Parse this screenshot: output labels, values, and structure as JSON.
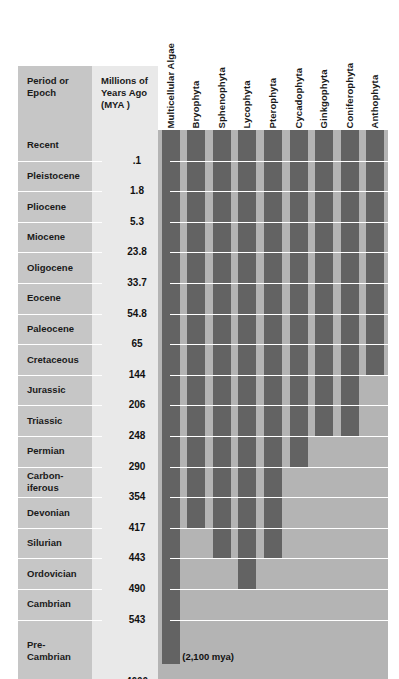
{
  "headers": {
    "period": "Period or\nEpoch",
    "period_line1": "Period or",
    "period_line2": "Epoch",
    "mya_line1": "Millions of",
    "mya_line2": "Years Ago",
    "mya_line3": "(MYA )"
  },
  "annotation": "(2,100 mya)",
  "colors": {
    "label_column": "#c6c6c6",
    "mya_column": "#e9e9e9",
    "plot_background": "#b4b4b4",
    "bar": "#636363",
    "gridline": "#ffffff",
    "text": "#1a1a1a",
    "page": "#ffffff"
  },
  "chart_data": {
    "type": "bar",
    "xlabel": "",
    "ylabel": "Millions of Years Ago (MYA)",
    "orientation": "vertical-range",
    "grid": true,
    "legend_position": "none",
    "note": "Each bar is a horizontal-range (stratigraphic range) bar spanning from its first-appearance age down-column to the present (top of chart).",
    "rows": [
      {
        "epoch": "Recent",
        "epoch_lines": [
          "Recent"
        ],
        "top_mya": 0,
        "bottom_mya": 0.1
      },
      {
        "epoch": "Pleistocene",
        "epoch_lines": [
          "Pleistocene"
        ],
        "top_mya": 0.1,
        "bottom_mya": 1.8
      },
      {
        "epoch": "Pliocene",
        "epoch_lines": [
          "Pliocene"
        ],
        "top_mya": 1.8,
        "bottom_mya": 5.3
      },
      {
        "epoch": "Miocene",
        "epoch_lines": [
          "Miocene"
        ],
        "top_mya": 5.3,
        "bottom_mya": 23.8
      },
      {
        "epoch": "Oligocene",
        "epoch_lines": [
          "Oligocene"
        ],
        "top_mya": 23.8,
        "bottom_mya": 33.7
      },
      {
        "epoch": "Eocene",
        "epoch_lines": [
          "Eocene"
        ],
        "top_mya": 33.7,
        "bottom_mya": 54.8
      },
      {
        "epoch": "Paleocene",
        "epoch_lines": [
          "Paleocene"
        ],
        "top_mya": 54.8,
        "bottom_mya": 65
      },
      {
        "epoch": "Cretaceous",
        "epoch_lines": [
          "Cretaceous"
        ],
        "top_mya": 65,
        "bottom_mya": 144
      },
      {
        "epoch": "Jurassic",
        "epoch_lines": [
          "Jurassic"
        ],
        "top_mya": 144,
        "bottom_mya": 206
      },
      {
        "epoch": "Triassic",
        "epoch_lines": [
          "Triassic"
        ],
        "top_mya": 206,
        "bottom_mya": 248
      },
      {
        "epoch": "Permian",
        "epoch_lines": [
          "Permian"
        ],
        "top_mya": 248,
        "bottom_mya": 290
      },
      {
        "epoch": "Carboniferous",
        "epoch_lines": [
          "Carbon-",
          "iferous"
        ],
        "top_mya": 290,
        "bottom_mya": 354
      },
      {
        "epoch": "Devonian",
        "epoch_lines": [
          "Devonian"
        ],
        "top_mya": 354,
        "bottom_mya": 417
      },
      {
        "epoch": "Silurian",
        "epoch_lines": [
          "Silurian"
        ],
        "top_mya": 417,
        "bottom_mya": 443
      },
      {
        "epoch": "Ordovician",
        "epoch_lines": [
          "Ordovician"
        ],
        "top_mya": 443,
        "bottom_mya": 490
      },
      {
        "epoch": "Cambrian",
        "epoch_lines": [
          "Cambrian"
        ],
        "top_mya": 490,
        "bottom_mya": 543
      },
      {
        "epoch": "Pre-Cambrian",
        "epoch_lines": [
          "Pre-",
          "Cambrian"
        ],
        "top_mya": 543,
        "bottom_mya": 4600
      }
    ],
    "boundaries": [
      ".1",
      "1.8",
      "5.3",
      "23.8",
      "33.7",
      "54.8",
      "65",
      "144",
      "206",
      "248",
      "290",
      "354",
      "417",
      "443",
      "490",
      "543",
      "4600"
    ],
    "categories": [
      "Multicellular Algae",
      "Bryophyta",
      "Sphenophyta",
      "Lycophyta",
      "Pterophyta",
      "Cycadophyta",
      "Ginkgophyta",
      "Coniferophyta",
      "Anthophyta"
    ],
    "series": [
      {
        "name": "Multicellular Algae",
        "first_appearance_mya": 2100,
        "extends_to_mya": 0,
        "origin_row": "Pre-Cambrian",
        "origin_label": "(2,100 mya)"
      },
      {
        "name": "Bryophyta",
        "first_appearance_mya": 354,
        "extends_to_mya": 0,
        "origin_row": "Devonian"
      },
      {
        "name": "Sphenophyta",
        "first_appearance_mya": 417,
        "extends_to_mya": 0,
        "origin_row": "Silurian"
      },
      {
        "name": "Lycophyta",
        "first_appearance_mya": 443,
        "extends_to_mya": 0,
        "origin_row": "Ordovician"
      },
      {
        "name": "Pterophyta",
        "first_appearance_mya": 417,
        "extends_to_mya": 0,
        "origin_row": "Silurian"
      },
      {
        "name": "Cycadophyta",
        "first_appearance_mya": 290,
        "extends_to_mya": 0,
        "origin_row": "Permian"
      },
      {
        "name": "Ginkgophyta",
        "first_appearance_mya": 248,
        "extends_to_mya": 0,
        "origin_row": "Triassic"
      },
      {
        "name": "Coniferophyta",
        "first_appearance_mya": 248,
        "extends_to_mya": 0,
        "origin_row": "Triassic"
      },
      {
        "name": "Anthophyta",
        "first_appearance_mya": 144,
        "extends_to_mya": 0,
        "origin_row": "Cretaceous"
      }
    ]
  }
}
